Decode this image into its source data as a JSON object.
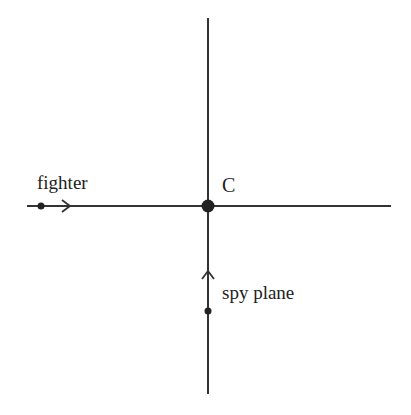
{
  "diagram": {
    "labels": {
      "fighter": "fighter",
      "center": "C",
      "spy_plane": "spy plane"
    },
    "colors": {
      "line": "#333333",
      "background": "#ffffff"
    }
  }
}
